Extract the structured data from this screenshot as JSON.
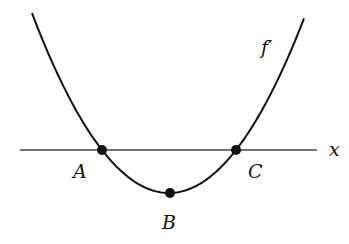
{
  "diagram": {
    "curve_label": "f′",
    "axis_label": "x",
    "points": [
      {
        "name": "A",
        "role": "root"
      },
      {
        "name": "B",
        "role": "minimum"
      },
      {
        "name": "C",
        "role": "root"
      }
    ]
  }
}
